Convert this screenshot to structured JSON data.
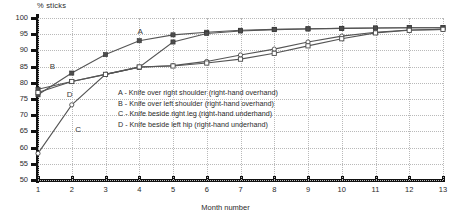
{
  "chart_data": {
    "type": "line",
    "title": "",
    "ylabel": "% sticks",
    "xlabel": "Month number",
    "x": [
      1,
      2,
      3,
      4,
      5,
      6,
      7,
      8,
      9,
      10,
      11,
      12,
      13
    ],
    "xticklabels": [
      "1",
      "2",
      "3",
      "4",
      "5",
      "6",
      "7",
      "8",
      "9",
      "10",
      "11",
      "12",
      "13"
    ],
    "yticklabels": [
      "100",
      "95",
      "90",
      "85",
      "80",
      "75",
      "70",
      "65",
      "60",
      "55",
      "50"
    ],
    "yticks": [
      100,
      95,
      90,
      85,
      80,
      75,
      70,
      65,
      60,
      55,
      50
    ],
    "ylim": [
      50,
      100
    ],
    "xlim": [
      1,
      13
    ],
    "grid": true,
    "legend_position": "inside-center",
    "series": [
      {
        "name": "A",
        "label": "A - Knife over right shoulder (right-hand overhand)",
        "marker": "filled-square",
        "values": [
          76.3,
          83.0,
          88.7,
          93.0,
          94.8,
          95.6,
          96.2,
          96.5,
          96.7,
          96.8,
          96.9,
          97.0,
          97.0
        ]
      },
      {
        "name": "B",
        "label": "B - Knife over left shoulder (right-hand overhand)",
        "marker": "filled-square",
        "values": [
          78.0,
          80.4,
          82.6,
          84.8,
          92.6,
          95.2,
          96.0,
          96.4,
          96.6,
          96.8,
          96.9,
          97.0,
          97.0
        ]
      },
      {
        "name": "C",
        "label": "C - Knife beside right leg (right-hand underhand)",
        "marker": "open-circle",
        "values": [
          58.2,
          73.2,
          82.6,
          84.8,
          85.3,
          86.6,
          88.6,
          90.4,
          92.6,
          94.4,
          95.6,
          96.3,
          96.5
        ]
      },
      {
        "name": "D",
        "label": "D - Knife beside left hip (right-hand underhand)",
        "marker": "open-square",
        "values": [
          77.0,
          80.4,
          82.6,
          84.9,
          85.2,
          86.1,
          87.3,
          89.1,
          91.4,
          93.6,
          95.4,
          96.2,
          96.5
        ]
      }
    ],
    "series_annotations": [
      {
        "name": "A",
        "text": "A",
        "x": 3.95,
        "y": 95.6
      },
      {
        "name": "B",
        "text": "B",
        "x": 1.35,
        "y": 85.0
      },
      {
        "name": "D",
        "text": "D",
        "x": 1.85,
        "y": 76.2
      },
      {
        "name": "C",
        "text": "C",
        "x": 2.1,
        "y": 65.3
      }
    ]
  }
}
